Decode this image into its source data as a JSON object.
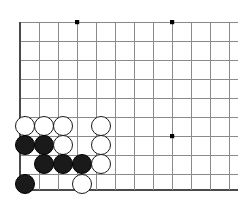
{
  "caption": {
    "text": ""
  },
  "colors": {
    "background": "#ffffff",
    "grid_line": "#8a8a8a",
    "edge_line": "#4a4a4a",
    "black_stone": "#1a1a1a",
    "white_stone": "#ffffff",
    "stone_outline": "#1a1a1a",
    "star_point": "#000000"
  },
  "board": {
    "type": "go-board-corner-diagram",
    "description": "Go board bottom-left corner position diagram",
    "grid": {
      "spacing_px": 19,
      "origin_x": 20,
      "origin_y": 22,
      "columns": 12,
      "rows": 9,
      "column_x": [
        20,
        39,
        58,
        77,
        96,
        115,
        134,
        153,
        172,
        191,
        210,
        229
      ],
      "row_y": [
        22,
        41,
        60,
        79,
        98,
        117,
        136,
        155,
        174,
        190
      ],
      "left_edge_x": 20,
      "bottom_edge_y": 190,
      "top_line_y": 22,
      "right_extent_x": 238
    },
    "star_points": [
      {
        "x": 77,
        "y": 22
      },
      {
        "x": 172,
        "y": 22
      },
      {
        "x": 172,
        "y": 136
      }
    ],
    "stone_radius_px": 10,
    "stones": [
      {
        "color": "white",
        "x": 25,
        "y": 126,
        "label": "w1"
      },
      {
        "color": "white",
        "x": 44,
        "y": 126,
        "label": "w2"
      },
      {
        "color": "white",
        "x": 63,
        "y": 126,
        "label": "w3"
      },
      {
        "color": "white",
        "x": 101,
        "y": 126,
        "label": "w4"
      },
      {
        "color": "black",
        "x": 25,
        "y": 145,
        "label": "b1"
      },
      {
        "color": "black",
        "x": 44,
        "y": 145,
        "label": "b2"
      },
      {
        "color": "white",
        "x": 63,
        "y": 145,
        "label": "w5"
      },
      {
        "color": "white",
        "x": 101,
        "y": 145,
        "label": "w6"
      },
      {
        "color": "black",
        "x": 44,
        "y": 164,
        "label": "b3"
      },
      {
        "color": "black",
        "x": 63,
        "y": 164,
        "label": "b4"
      },
      {
        "color": "black",
        "x": 82,
        "y": 164,
        "label": "b5"
      },
      {
        "color": "white",
        "x": 101,
        "y": 164,
        "label": "w7"
      },
      {
        "color": "black",
        "x": 25,
        "y": 184,
        "label": "b6"
      },
      {
        "color": "white",
        "x": 82,
        "y": 184,
        "label": "w8"
      }
    ]
  }
}
